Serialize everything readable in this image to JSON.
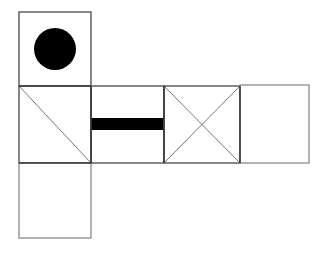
{
  "figure": {
    "canvas": {
      "width": 328,
      "height": 253
    },
    "background_color": "#FFFFFF",
    "stroke_color": "#444444",
    "fill_color": "#000000",
    "stroke_width": 1.4,
    "thick_stroke_width": 1.8,
    "hairline_width": 0.9,
    "panels": [
      {
        "id": "panel-top-circle",
        "name": "top-square-with-circle",
        "x": 19,
        "y": 12,
        "width": 72,
        "height": 74,
        "marking": "filled-circle",
        "circle": {
          "cx": 55,
          "cy": 49,
          "r": 21
        }
      },
      {
        "id": "panel-mid-left-diagonal",
        "name": "middle-left-square-with-diagonal",
        "x": 19,
        "y": 86,
        "width": 72,
        "height": 77,
        "marking": "diagonal-tl-br"
      },
      {
        "id": "panel-bottom-plain",
        "name": "bottom-left-square-plain",
        "x": 19,
        "y": 163,
        "width": 72,
        "height": 75,
        "marking": "none"
      },
      {
        "id": "panel-mid-bar",
        "name": "middle-rectangle-with-black-bar",
        "x": 91,
        "y": 86,
        "width": 73,
        "height": 77,
        "marking": "horizontal-black-bar",
        "bar": {
          "x": 91,
          "y": 118,
          "width": 73,
          "height": 12
        }
      },
      {
        "id": "panel-mid-x",
        "name": "middle-square-with-x-cross",
        "x": 164,
        "y": 86,
        "width": 76,
        "height": 77,
        "marking": "x-cross"
      },
      {
        "id": "panel-right-plain",
        "name": "right-rectangle-plain",
        "x": 240,
        "y": 85,
        "width": 69,
        "height": 78,
        "marking": "none"
      }
    ],
    "labels": {
      "circle_label": "",
      "bar_label": "",
      "diagram_caption": ""
    }
  }
}
